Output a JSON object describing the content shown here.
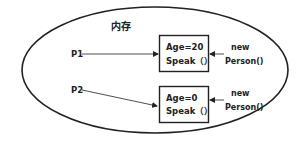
{
  "memory": {
    "label": "内存"
  },
  "references": [
    {
      "label": "P1"
    },
    {
      "label": "P2"
    }
  ],
  "objects": [
    {
      "field": "Age=20",
      "method": "Speak（）"
    },
    {
      "field": "Age=0",
      "method": "Speak（）"
    }
  ],
  "constructors": [
    {
      "line1": "new",
      "line2": "Person()"
    },
    {
      "line1": "new",
      "line2": "Person()"
    }
  ],
  "colors": {
    "stroke": "#222222",
    "background": "#ffffff"
  }
}
